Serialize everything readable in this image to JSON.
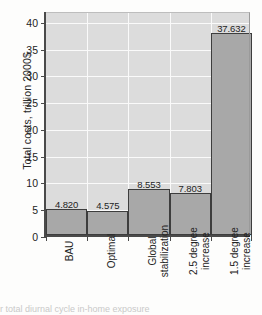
{
  "chart_data": {
    "type": "bar",
    "title": "",
    "xlabel": "",
    "ylabel": "Total costs, trillion 2000$",
    "ylim": [
      0,
      42
    ],
    "yticks": [
      0,
      5,
      10,
      15,
      20,
      25,
      30,
      35,
      40
    ],
    "grid": true,
    "legend": "none",
    "categories": [
      "BAU",
      "Optimal",
      "Global stabilization",
      "2.5 degree increase",
      "1.5 degree increase"
    ],
    "category_lines": [
      [
        "BAU",
        ""
      ],
      [
        "Optimal",
        ""
      ],
      [
        "Global",
        "stabilization"
      ],
      [
        "2.5 degree",
        "increase"
      ],
      [
        "1.5 degree",
        "increase"
      ]
    ],
    "values": [
      4.82,
      4.575,
      8.553,
      7.803,
      37.632
    ],
    "value_labels": [
      "4.820",
      "4.575",
      "8.553",
      "7.803",
      "37.632"
    ],
    "colors": {
      "bar_fill": "#a8a8a8",
      "bar_edge": "#3d3d3d",
      "plot_background": "#dcdcdc",
      "gridline": "#fafafa",
      "axis": "#4a4a4a",
      "text": "#232323"
    }
  },
  "artifact": {
    "text": "r total diurnal cycle in-home exposure"
  }
}
